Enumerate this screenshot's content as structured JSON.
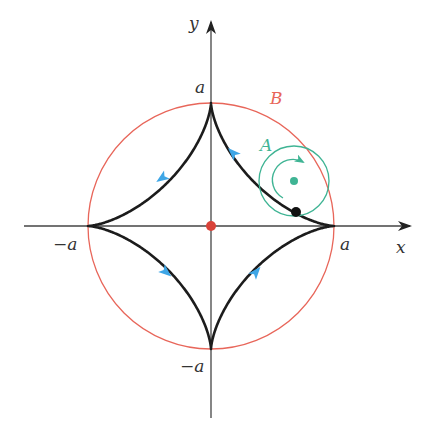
{
  "figure": {
    "axes": {
      "x_label": "x",
      "y_label": "y",
      "origin_px": [
        211,
        226
      ],
      "scale_a_px": 123
    },
    "tick_labels": {
      "x_pos": "a",
      "x_neg": "−a",
      "y_pos": "a",
      "y_neg": "−a"
    },
    "curves": {
      "astroid": {
        "label": "",
        "color": "#222222",
        "direction": "counterclockwise"
      },
      "circle_B": {
        "label": "B",
        "color": "#e8665a",
        "radius": "a"
      },
      "circle_A": {
        "label": "A",
        "color": "#3fb494",
        "radius": "a/4",
        "rotation": "counterclockwise"
      }
    },
    "markers": {
      "origin_dot_color": "#d9433a",
      "tracing_point_color": "#111111",
      "circle_A_center_color": "#3fb494",
      "arrow_color": "#3ea6e6"
    }
  }
}
